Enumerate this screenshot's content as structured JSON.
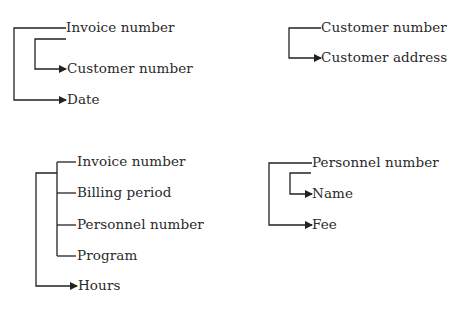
{
  "diagrams": [
    {
      "id": "invoice",
      "determinant": "Invoice number",
      "attributes": [
        "Customer number",
        "Date"
      ],
      "transitive": {
        "from": "Customer number",
        "via": "Invoice number"
      }
    },
    {
      "id": "customer",
      "determinant": "Customer number",
      "attributes": [
        "Customer address"
      ]
    },
    {
      "id": "billing",
      "determinant_group": [
        "Invoice number",
        "Billing period",
        "Personnel number",
        "Program"
      ],
      "attributes": [
        "Hours"
      ]
    },
    {
      "id": "personnel",
      "determinant": "Personnel number",
      "attributes": [
        "Name",
        "Fee"
      ]
    }
  ],
  "labels": {
    "d1_invoice": "Invoice number",
    "d1_customer": "Customer number",
    "d1_date": "Date",
    "d2_customer": "Customer number",
    "d2_address": "Customer address",
    "d3_invoice": "Invoice number",
    "d3_billing": "Billing period",
    "d3_personnel": "Personnel number",
    "d3_program": "Program",
    "d3_hours": "Hours",
    "d4_personnel": "Personnel number",
    "d4_name": "Name",
    "d4_fee": "Fee"
  },
  "colors": {
    "line": "#222222",
    "text": "#2a2a2a",
    "background": "#ffffff"
  }
}
